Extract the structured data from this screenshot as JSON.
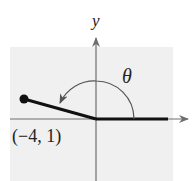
{
  "diagram": {
    "type": "angle-in-standard-position",
    "axis_labels": {
      "y": "y"
    },
    "angle_label": "θ",
    "point": {
      "label": "(−4, 1)",
      "x": -4,
      "y": 1
    },
    "colors": {
      "background_panel": "#f0f0f0",
      "axes": "#6e6e6e",
      "terminal_side": "#111111",
      "arc": "#555555"
    }
  }
}
